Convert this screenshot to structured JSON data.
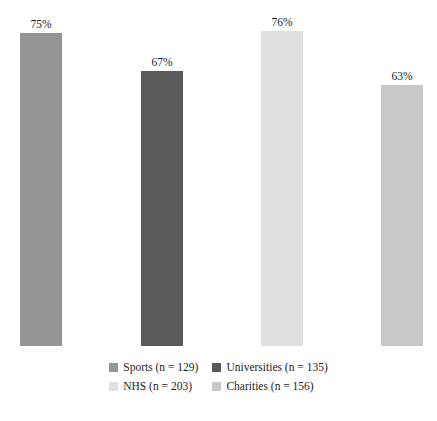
{
  "chart_data": {
    "type": "bar",
    "title": "",
    "subtitle": "",
    "xlabel": "",
    "ylabel": "",
    "ylim": [
      0,
      100
    ],
    "grid": false,
    "legend_position": "bottom",
    "categories": [
      "Sports",
      "Universities",
      "NHS",
      "Charities"
    ],
    "values": [
      75,
      67,
      76,
      63
    ],
    "value_labels": [
      "75%",
      "67%",
      "76%",
      "63%"
    ],
    "sample_sizes": [
      129,
      135,
      203,
      156
    ],
    "legend_entries": [
      {
        "label": "Sports (n = 129)",
        "color": "#959595"
      },
      {
        "label": "Universities (n = 135)",
        "color": "#595959"
      },
      {
        "label": "NHS (n = 203)",
        "color": "#e0e0e0"
      },
      {
        "label": "Charities (n = 156)",
        "color": "#c8c8c8"
      }
    ],
    "bars": [
      {
        "name": "Sports",
        "label": "75%",
        "color": "#959595",
        "x": 20,
        "width": 42,
        "top": 33
      },
      {
        "name": "Universities",
        "label": "67%",
        "color": "#595959",
        "x": 141,
        "width": 42,
        "top": 71
      },
      {
        "name": "NHS",
        "label": "76%",
        "color": "#e0e0e0",
        "x": 261,
        "width": 42,
        "top": 31
      },
      {
        "name": "Charities",
        "label": "63%",
        "color": "#c8c8c8",
        "x": 381,
        "width": 42,
        "top": 85
      }
    ]
  }
}
